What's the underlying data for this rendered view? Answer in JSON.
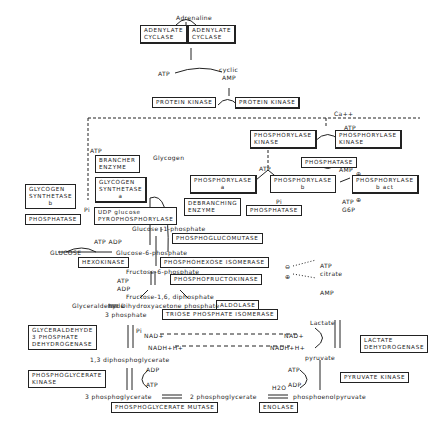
{
  "diagram": {
    "signals": {
      "adrenaline": "Adrenaline",
      "atp1": "ATP",
      "cyclic_amp_1": "cyclic",
      "cyclic_amp_2": "AMP",
      "ca": "Ca++",
      "atp_pk": "ATP",
      "pi_pk": "Pi",
      "atp_phos": "ATP",
      "amp_b": "AMP",
      "plus1": "⊕",
      "atp_b": "ATP",
      "g6p_b": "G6P",
      "plus2": "⊕",
      "pi_phos": "Pi",
      "atp_brancher": "ATP",
      "pi_syn": "Pi",
      "glycogen": "Glycogen"
    },
    "enzymes": {
      "adenylate_cyclase_inactive": [
        "ADENYLATE",
        "CYCLASE"
      ],
      "adenylate_cyclase_active": [
        "ADENYLATE",
        "CYCLASE"
      ],
      "protein_kinase_inactive": "PROTEIN KINASE",
      "protein_kinase_active": "PROTEIN KINASE",
      "phosphorylase_kinase_a": [
        "PHOSPHORYLASE",
        "KINASE"
      ],
      "phosphorylase_kinase_b": [
        "PHOSPHORYLASE",
        "KINASE"
      ],
      "phosphatase_pk": "PHOSPHATASE",
      "brancher": [
        "BRANCHER",
        "ENZYME"
      ],
      "glycogen_synthetase_a": [
        "GLYCOGEN",
        "SYNTHETASE",
        "a"
      ],
      "glycogen_synthetase_b": [
        "GLYCOGEN",
        "SYNTHETASE",
        "b"
      ],
      "phosphatase_syn": "PHOSPHATASE",
      "udp_pyrophosphorylase": [
        "UDP glucose",
        "PYROPHOSPHORYLASE"
      ],
      "phosphorylase_a": [
        "PHOSPHORYLASE",
        "a"
      ],
      "phosphorylase_b": [
        "PHOSPHORYLASE",
        "b"
      ],
      "phosphorylase_b_act": [
        "PHOSPHORYLASE",
        "b act"
      ],
      "debranching": [
        "DEBRANCHING",
        "ENZYME"
      ],
      "phosphatase_phos": "PHOSPHATASE",
      "phosphoglucomutase": "PHOSPHOGLUCOMUTASE",
      "hexokinase": "HEXOKINASE",
      "phosphohexose_isomerase": "PHOSPHOHEXOSE ISOMERASE",
      "phosphofructokinase": "PHOSPHOFRUCTOKINASE",
      "aldolase": "ALDOLASE",
      "triose_isomerase": "TRIOSE PHOSPHATE ISOMERASE",
      "g3p_dehydrogenase": [
        "GLYCERALDEHYDE",
        "3 PHOSPHATE",
        "DEHYDROGENASE"
      ],
      "lactate_dehydrogenase": [
        "LACTATE",
        "DEHYDROGENASE"
      ],
      "phosphoglycerate_kinase": [
        "PHOSPHOGLYCERATE",
        "KINASE"
      ],
      "pyruvate_kinase": "PYRUVATE KINASE",
      "phosphoglycerate_mutase": "PHOSPHOGLYCERATE MUTASE",
      "enolase": "ENOLASE"
    },
    "metabolites": {
      "glucose_1p": "Glucose -1-phosphate",
      "glucose": "GLUCOSE",
      "atp_adp_hex": "ATP ADP",
      "glucose_6p": "Glucose-6-phosphate",
      "fructose_6p": "Fructose-6-phosphate",
      "atp_pfk": "ATP",
      "adp_pfk": "ADP",
      "inhib_atp": "ATP",
      "inhib_citrate": "citrate",
      "act_amp": "AMP",
      "minus": "⊖",
      "plus": "⊕",
      "fructose_16": "Fructose-1,6, diphosphate",
      "glyceraldehyde": "Glyceraldehyde",
      "three_phosphate": "3 phosphate",
      "dhap": "Dihydroxyacetone phosphate",
      "pi_gapdh": "Pi",
      "nad_left": "NAD+",
      "nadh_left": "NADH+H+",
      "bpg": "1,3 diphosphoglycerate",
      "adp_pgk": "ADP",
      "atp_pgk": "ATP",
      "pg3": "3 phosphoglycerate",
      "pg2": "2 phosphoglycerate",
      "h2o": "H2O",
      "pep": "phosphoenolpyruvate",
      "atp_pk2": "ATP",
      "adp_pk2": "ADP",
      "pyruvate": "pyruvate",
      "lactate": "Lactate",
      "nad_right": "NAD+",
      "nadh_right": "NADH+H+"
    }
  }
}
